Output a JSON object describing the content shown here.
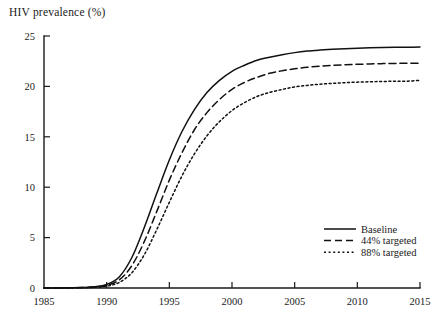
{
  "figure": {
    "axis_title": "HIV prevalence (%)",
    "background_color": "#ffffff",
    "ink_color": "#111111"
  },
  "legend": {
    "entries": [
      {
        "label": "Baseline",
        "style": "solid",
        "dash": "none"
      },
      {
        "label": "44% targeted",
        "style": "dashed",
        "dash": "7,4"
      },
      {
        "label": "88% targeted",
        "style": "dotted",
        "dash": "2,2.6"
      }
    ]
  },
  "chart_data": {
    "type": "line",
    "title": "HIV prevalence (%)",
    "xlabel": "",
    "ylabel": "HIV prevalence (%)",
    "xlim": [
      1985,
      2015
    ],
    "ylim": [
      0,
      25
    ],
    "xticks": [
      1985,
      1990,
      1995,
      2000,
      2005,
      2010,
      2015
    ],
    "yticks": [
      0,
      5,
      10,
      15,
      20,
      25
    ],
    "xtick_labels": [
      "1985",
      "1990",
      "1995",
      "2000",
      "2005",
      "2010",
      "2015"
    ],
    "ytick_labels": [
      "0",
      "5",
      "10",
      "15",
      "20",
      "25"
    ],
    "grid": false,
    "legend_position": "lower-right-inside",
    "x": [
      1985,
      1986,
      1987,
      1988,
      1989,
      1990,
      1991,
      1992,
      1993,
      1994,
      1995,
      1996,
      1997,
      1998,
      1999,
      2000,
      2001,
      2002,
      2003,
      2004,
      2005,
      2006,
      2007,
      2008,
      2009,
      2010,
      2011,
      2012,
      2013,
      2014,
      2015
    ],
    "series": [
      {
        "name": "Baseline",
        "style": "solid",
        "values": [
          0.0,
          0.0,
          0.02,
          0.05,
          0.12,
          0.35,
          1.1,
          3.0,
          6.0,
          9.4,
          12.7,
          15.5,
          17.7,
          19.4,
          20.6,
          21.5,
          22.1,
          22.6,
          22.9,
          23.15,
          23.35,
          23.5,
          23.6,
          23.68,
          23.74,
          23.79,
          23.83,
          23.86,
          23.88,
          23.89,
          23.9
        ]
      },
      {
        "name": "44% targeted",
        "style": "dashed",
        "values": [
          0.0,
          0.0,
          0.01,
          0.04,
          0.09,
          0.26,
          0.8,
          2.2,
          4.6,
          7.6,
          10.7,
          13.4,
          15.7,
          17.4,
          18.7,
          19.7,
          20.4,
          20.9,
          21.3,
          21.55,
          21.75,
          21.9,
          22.0,
          22.08,
          22.14,
          22.19,
          22.23,
          22.26,
          22.28,
          22.29,
          22.3
        ]
      },
      {
        "name": "88% targeted",
        "style": "dotted",
        "values": [
          0.0,
          0.0,
          0.01,
          0.02,
          0.06,
          0.18,
          0.55,
          1.5,
          3.3,
          5.8,
          8.5,
          11.1,
          13.3,
          15.1,
          16.5,
          17.6,
          18.4,
          19.0,
          19.4,
          19.7,
          19.95,
          20.1,
          20.22,
          20.3,
          20.37,
          20.42,
          20.46,
          20.49,
          20.51,
          20.52,
          20.6
        ]
      }
    ]
  }
}
